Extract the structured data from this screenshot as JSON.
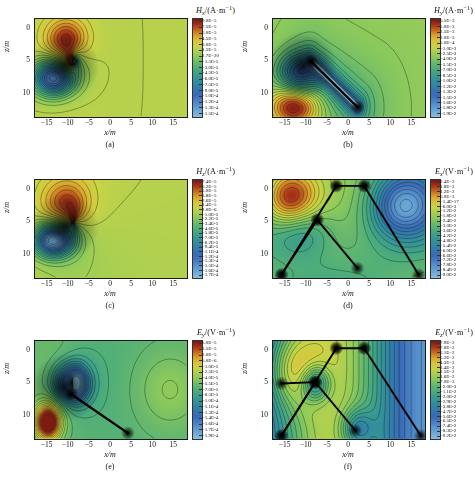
{
  "figure": {
    "axis": {
      "xlabel": "x/m",
      "ylabel": "z/m",
      "xticks": [
        "-15",
        "-10",
        "-5",
        "0",
        "5",
        "10",
        "15"
      ],
      "yticks": [
        "0",
        "5",
        "10"
      ],
      "xlim": [
        -18,
        18
      ],
      "ylim": [
        13.5,
        -1.5
      ]
    },
    "panels": [
      {
        "id": "a",
        "caption": "(a)",
        "quantity": "H",
        "component": "x",
        "unit": "/(A·m",
        "unit_sup": "−1",
        "unit_close": ")",
        "colorbar_title": "Hx/(A·m−1)",
        "colorbar_labels": [
          "9.0E-5",
          "7.5E-5",
          "6.0E-5",
          "4.5E-5",
          "3.0E-5",
          "1.5E-5",
          "2.7E-20",
          "-1.5E-5",
          "-3.0E-5",
          "-4.5E-5",
          "-6.0E-5",
          "-7.5E-5",
          "-9.0E-5",
          "-1.0E-4",
          "-1.2E-4",
          "-1.3E-4",
          "-1.5E-4"
        ],
        "vmax": 9e-05,
        "vmin": -0.00015
      },
      {
        "id": "b",
        "caption": "(b)",
        "quantity": "H",
        "component": "y",
        "colorbar_title": "Hy/(A·m−1)",
        "colorbar_labels": [
          "6.5E-3",
          "5.0E-3",
          "3.5E-3",
          "2.0E-3",
          "5.0E-4",
          "-1.0E-3",
          "-2.5E-3",
          "-4.0E-3",
          "-5.5E-3",
          "-7.0E-3",
          "-8.5E-3",
          "-1.0E-2",
          "-1.2E-2",
          "-1.3E-2",
          "-1.5E-2",
          "-1.6E-2",
          "-1.8E-2",
          "-1.9E-2"
        ],
        "vmax": 0.0065,
        "vmin": -0.019
      },
      {
        "id": "c",
        "caption": "(c)",
        "quantity": "H",
        "component": "z",
        "colorbar_title": "Hz/(A·m−1)",
        "colorbar_labels": [
          "7.4E-5",
          "6.2E-5",
          "5.0E-5",
          "3.8E-5",
          "2.6E-5",
          "1.4E-5",
          "2.0E-6",
          "-1.0E-5",
          "-2.2E-5",
          "-3.4E-5",
          "-4.6E-5",
          "-5.8E-5",
          "-7.0E-5",
          "-8.2E-5",
          "-9.4E-5",
          "-1.1E-4",
          "-1.2E-4",
          "-1.3E-4",
          "-1.5E-4",
          "-1.6E-4",
          "-1.7E-4"
        ],
        "vmax": 7.4e-05,
        "vmin": -0.00017
      },
      {
        "id": "d",
        "caption": "(d)",
        "quantity": "E",
        "component": "x",
        "colorbar_title": "Ex/(V·m−1)",
        "colorbar_labels": [
          "2.4E-2",
          "1.8E-2",
          "1.2E-2",
          "6.0E-3",
          "-1.4E-17",
          "-6.0E-3",
          "-1.2E-2",
          "-1.8E-2",
          "-2.4E-2",
          "-3.0E-2",
          "-3.6E-2",
          "-4.2E-2",
          "-4.8E-2",
          "-5.4E-2",
          "-6.0E-2",
          "-6.6E-2",
          "-7.2E-2",
          "-7.8E-2",
          "-8.4E-2",
          "-9.0E-2"
        ],
        "vmax": 0.024,
        "vmin": -0.09
      },
      {
        "id": "e",
        "caption": "(e)",
        "quantity": "E",
        "component": "y",
        "colorbar_title": "Ey/(V·m−1)",
        "colorbar_labels": [
          "5.0E-5",
          "3.5E-5",
          "2.0E-5",
          "5.0E-6",
          "-1.0E-5",
          "-2.5E-5",
          "-4.0E-5",
          "-5.5E-5",
          "-7.0E-5",
          "-8.5E-5",
          "-1.0E-4",
          "-1.1E-4",
          "-1.3E-4",
          "-1.4E-4",
          "-1.6E-4",
          "-1.7E-4",
          "-1.9E-4"
        ],
        "vmax": 5e-05,
        "vmin": -0.00019
      },
      {
        "id": "f",
        "caption": "(f)",
        "quantity": "E",
        "component": "z",
        "colorbar_title": "Ez/(V·m−1)",
        "colorbar_labels": [
          "7.9E-2",
          "7.0E-2",
          "6.1E-2",
          "5.2E-2",
          "4.3E-2",
          "3.4E-2",
          "2.5E-2",
          "1.6E-2",
          "7.0E-3",
          "-2.0E-3",
          "-1.1E-2",
          "-2.0E-2",
          "-2.9E-2",
          "-3.8E-2",
          "-4.7E-2",
          "-5.6E-2",
          "-6.5E-2",
          "-7.4E-2",
          "-8.3E-2",
          "-9.2E-2"
        ],
        "vmax": 0.079,
        "vmin": -0.092
      }
    ],
    "colormap": [
      "#7d1a12",
      "#a8331a",
      "#c8691f",
      "#dba02c",
      "#d9c43a",
      "#c9d346",
      "#a8cf52",
      "#8ac95c",
      "#6ab96b",
      "#4fae79",
      "#3fa08a",
      "#359497",
      "#3286a4",
      "#3378b0",
      "#3a6ab8",
      "#4a7fc4",
      "#5a95cf",
      "#6fa9d8",
      "#86bce0"
    ]
  }
}
